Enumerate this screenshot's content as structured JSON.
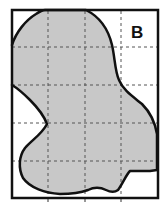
{
  "figure": {
    "panel_label": "B",
    "colors": {
      "frame": "#111111",
      "grid": "#555555",
      "fill": "#c8c8c8",
      "outline": "#111111",
      "background": "#ffffff"
    },
    "grid": {
      "columns": 4,
      "rows": 5,
      "style": "dashed"
    }
  }
}
